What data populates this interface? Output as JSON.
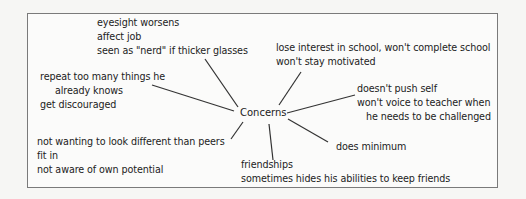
{
  "diagram": {
    "type": "concept-map",
    "center": {
      "label": "Concerns"
    },
    "branches": [
      {
        "id": "eyesight",
        "lines": [
          "eyesight worsens",
          "affect job",
          "seen as \"nerd\" if thicker glasses"
        ]
      },
      {
        "id": "repeat",
        "lines": [
          "repeat too many things he",
          "already knows",
          "get discouraged"
        ]
      },
      {
        "id": "peers",
        "lines": [
          "not wanting to look different than peers",
          "fit in",
          "not aware of own potential"
        ]
      },
      {
        "id": "friendships",
        "lines": [
          "friendships",
          "sometimes hides his abilities to keep friends"
        ]
      },
      {
        "id": "minimum",
        "lines": [
          "does minimum"
        ]
      },
      {
        "id": "push",
        "lines": [
          "doesn't push self",
          "won't voice to teacher when",
          "he needs to be challenged"
        ]
      },
      {
        "id": "interest",
        "lines": [
          "lose interest in school, won't complete school",
          "won't stay motivated"
        ]
      }
    ],
    "colors": {
      "border": "#7a7a7a",
      "line": "#333333",
      "text": "#222222",
      "background": "#fbfbfa"
    }
  }
}
